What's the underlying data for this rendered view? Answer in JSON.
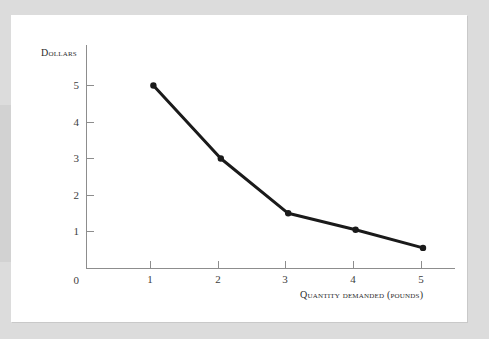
{
  "figure": {
    "background_color": "#dcdcdc",
    "page_color": "#ffffff",
    "axis_color": "#8d8d8d",
    "series_color": "#1a1a1a"
  },
  "chart_data": {
    "type": "line",
    "title": "",
    "xlabel": "Quantity demanded (pounds)",
    "ylabel": "Dollars",
    "xlim": [
      0,
      5.6
    ],
    "ylim": [
      0,
      6.1
    ],
    "grid": false,
    "legend": "none",
    "x_tick_labels": [
      "1",
      "2",
      "3",
      "4",
      "5"
    ],
    "y_tick_labels": [
      "1",
      "2",
      "3",
      "4",
      "5"
    ],
    "origin_label": "0",
    "x": [
      1,
      2,
      3,
      4,
      5
    ],
    "values": [
      5.0,
      3.0,
      1.5,
      1.05,
      0.55
    ],
    "markers": "filled-circle",
    "series": [
      {
        "name": "Demand curve",
        "points": [
          {
            "x": 1,
            "y": 5.0
          },
          {
            "x": 2,
            "y": 3.0
          },
          {
            "x": 3,
            "y": 1.5
          },
          {
            "x": 4,
            "y": 1.05
          },
          {
            "x": 5,
            "y": 0.55
          }
        ]
      }
    ]
  },
  "axis": {
    "y_title": "Dollars",
    "x_title": "Quantity demanded (pounds)",
    "origin": "0",
    "y_ticks": [
      {
        "label": "5"
      },
      {
        "label": "4"
      },
      {
        "label": "3"
      },
      {
        "label": "2"
      },
      {
        "label": "1"
      }
    ],
    "x_ticks": [
      {
        "label": "1"
      },
      {
        "label": "2"
      },
      {
        "label": "3"
      },
      {
        "label": "4"
      },
      {
        "label": "5"
      }
    ]
  }
}
